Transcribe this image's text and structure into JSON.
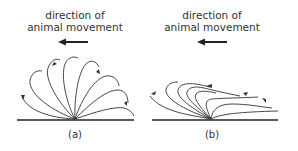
{
  "panels": [
    {
      "id": "a",
      "heading_line1": "direction of",
      "heading_line2": "animal movement",
      "caption": "(a)",
      "arrow_direction": "left",
      "description": "hairs/whip-like appendages fanning out from a single pivot point on the ground line, each curving and tipped with small direction arrows"
    },
    {
      "id": "b",
      "heading_line1": "direction of",
      "heading_line2": "animal movement",
      "caption": "(b)",
      "arrow_direction": "left",
      "description": "curves sweeping from pivot point, bent backward toward the direction of movement with small arrows"
    }
  ],
  "colors": {
    "stroke": "#333333",
    "background": "#ffffff"
  }
}
